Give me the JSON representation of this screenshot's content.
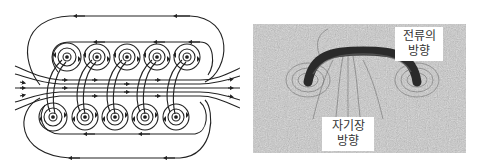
{
  "figure": {
    "left_panel": {
      "title": "solenoid-magnetic-field-lines-diagram",
      "description": "Cross-section of coil: two rows of five conductor loops with concentric field circles, straight field lines through the center, looping return lines around outside",
      "top_row_conductors": 5,
      "bottom_row_conductors": 5,
      "line_color": "#222222"
    },
    "right_panel": {
      "title": "iron-filings-photo",
      "description": "Iron filings pattern around a single curved current-carrying wire loop",
      "labels": {
        "current_direction": {
          "line1": "전류의",
          "line2": "방향"
        },
        "field_direction": {
          "line1": "자기장",
          "line2": "방향"
        }
      },
      "background_color": "#bdbdbd",
      "wire_color": "#2a2a2a"
    }
  }
}
